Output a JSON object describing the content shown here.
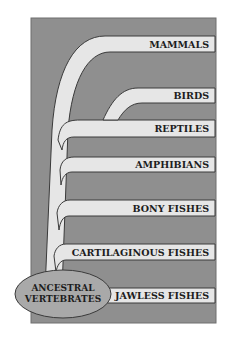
{
  "diagram": {
    "type": "phylogenetic-tree",
    "root": "ANCESTRAL VERTEBRATES",
    "root_lines": [
      "ANCESTRAL",
      "VERTEBRATES"
    ],
    "branches": [
      {
        "label": "MAMMALS"
      },
      {
        "label": "BIRDS"
      },
      {
        "label": "REPTILES"
      },
      {
        "label": "AMPHIBIANS"
      },
      {
        "label": "BONY FISHES"
      },
      {
        "label": "CARTILAGINOUS FISHES"
      },
      {
        "label": "JAWLESS FISHES"
      }
    ],
    "colors": {
      "background": "#8f8f8f",
      "branch": "#e6e6e6",
      "outline": "#3a3a3a",
      "root_fill": "#a9a9a9"
    }
  }
}
